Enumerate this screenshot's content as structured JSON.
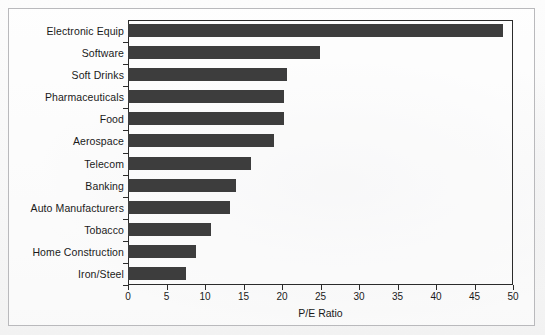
{
  "chart_data": {
    "type": "bar",
    "orientation": "horizontal",
    "title": "",
    "xlabel": "P/E Ratio",
    "ylabel": "",
    "xlim": [
      0,
      50
    ],
    "xticks": [
      0,
      5,
      10,
      15,
      20,
      25,
      30,
      35,
      40,
      45,
      50
    ],
    "grid": false,
    "legend": null,
    "bar_color": "#3d3d3d",
    "categories": [
      "Electronic Equip",
      "Software",
      "Soft Drinks",
      "Pharmaceuticals",
      "Food",
      "Aerospace",
      "Telecom",
      "Banking",
      "Auto Manufacturers",
      "Tobacco",
      "Home Construction",
      "Iron/Steel"
    ],
    "values": [
      48.7,
      24.9,
      20.7,
      20.3,
      20.2,
      19.0,
      16.0,
      14.0,
      13.2,
      10.8,
      8.8,
      7.5
    ]
  }
}
